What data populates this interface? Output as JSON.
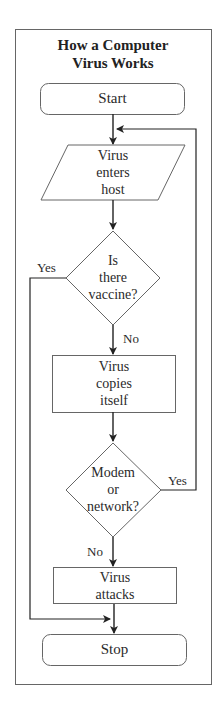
{
  "title": {
    "line1": "How a Computer",
    "line2": "Virus Works"
  },
  "nodes": {
    "start": {
      "label": "Start",
      "shape": "rounded-rect"
    },
    "enters": {
      "line1": "Virus",
      "line2": "enters",
      "line3": "host",
      "shape": "parallelogram"
    },
    "vaccine": {
      "line1": "Is",
      "line2": "there",
      "line3": "vaccine?",
      "shape": "diamond"
    },
    "copies": {
      "line1": "Virus",
      "line2": "copies",
      "line3": "itself",
      "shape": "rect"
    },
    "network": {
      "line1": "Modem",
      "line2": "or",
      "line3": "network?",
      "shape": "diamond"
    },
    "attacks": {
      "line1": "Virus",
      "line2": "attacks",
      "shape": "rect"
    },
    "stop": {
      "label": "Stop",
      "shape": "rounded-rect"
    }
  },
  "edges": {
    "vaccine_yes": "Yes",
    "vaccine_no": "No",
    "network_yes": "Yes",
    "network_no": "No"
  },
  "colors": {
    "stroke": "#555555",
    "arrow": "#222222",
    "text": "#2a2a2a",
    "background": "#ffffff"
  }
}
